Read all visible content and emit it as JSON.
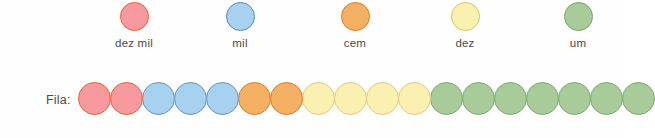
{
  "legend": {
    "items": [
      {
        "label": "dez mil",
        "x": 134,
        "fill": "#f79aa0",
        "stroke": "#e8612c"
      },
      {
        "label": "mil",
        "x": 240,
        "fill": "#a6d2f0",
        "stroke": "#5b86b5"
      },
      {
        "label": "cem",
        "x": 355,
        "fill": "#f5a köp",
        "stroke": "#e07b1f"
      },
      {
        "label": "dez",
        "x": 465,
        "fill": "#faf0b0",
        "stroke": "#d8c36a"
      },
      {
        "label": "um",
        "x": 578,
        "fill": "#a8cb99",
        "stroke": "#74a567"
      }
    ]
  },
  "fila": {
    "label": "Fila:",
    "groups": [
      {
        "name": "dez mil",
        "count": 2,
        "fill": "#f79aa0",
        "stroke": "#e8612c"
      },
      {
        "name": "mil",
        "count": 3,
        "fill": "#a6d2f0",
        "stroke": "#6c8fbe"
      },
      {
        "name": "cem",
        "count": 2,
        "fill": "#f5b163",
        "stroke": "#e0762a"
      },
      {
        "name": "dez",
        "count": 4,
        "fill": "#faf0b0",
        "stroke": "#e3c98a"
      },
      {
        "name": "um",
        "count": 7,
        "fill": "#a8cb99",
        "stroke": "#7aa96c"
      }
    ],
    "total": 18
  },
  "chart_data": {
    "type": "bar",
    "title": "",
    "categories": [
      "dez mil",
      "mil",
      "cem",
      "dez",
      "um"
    ],
    "values": [
      2,
      3,
      2,
      4,
      7
    ],
    "xlabel": "",
    "ylabel": "",
    "legend_position": "top"
  }
}
